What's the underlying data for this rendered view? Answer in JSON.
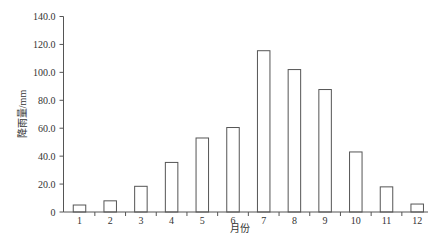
{
  "chart_data": {
    "type": "bar",
    "title": "",
    "xlabel": "月份",
    "ylabel": "降雨量/mm",
    "categories": [
      "1",
      "2",
      "3",
      "4",
      "5",
      "6",
      "7",
      "8",
      "9",
      "10",
      "11",
      "12"
    ],
    "values": [
      5.0,
      8.0,
      18.4,
      35.5,
      53.0,
      60.5,
      115.5,
      102.0,
      87.7,
      43.0,
      18.0,
      5.7
    ],
    "ylim": [
      0,
      140
    ],
    "yticks": [
      "0",
      "20.0",
      "40.0",
      "60.0",
      "80.0",
      "100.0",
      "120.0",
      "140.0"
    ],
    "grid": false,
    "legend": null,
    "colors": {
      "bar_fill": "#ffffff",
      "bar_stroke": "#555555",
      "axis": "#555555"
    }
  }
}
